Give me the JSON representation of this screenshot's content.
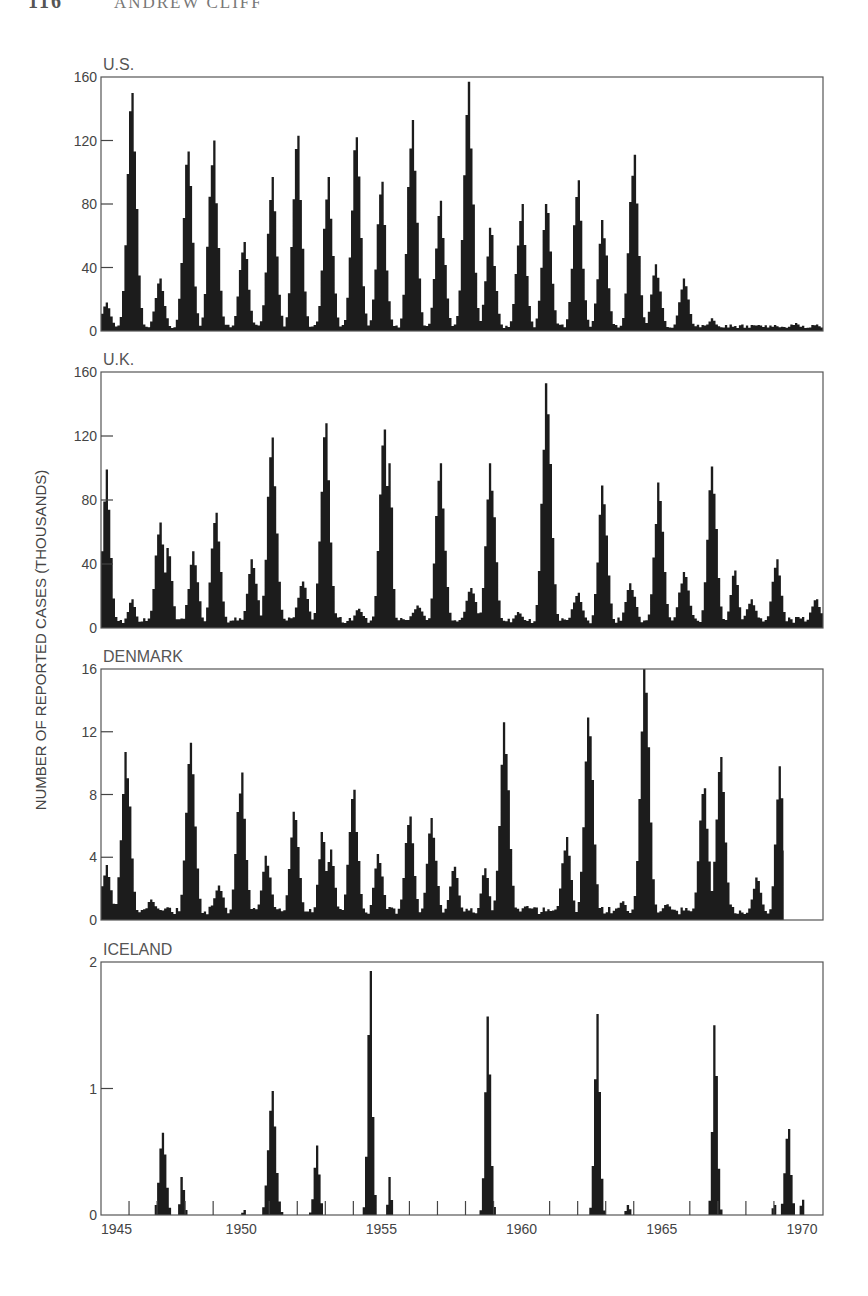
{
  "running_head": {
    "page_number": "116",
    "author": "ANDREW CLIFF"
  },
  "figure": {
    "ylabel": "NUMBER OF REPORTED CASES (THOUSANDS)",
    "x_axis": {
      "start_year": 1945,
      "end_year": 1970.75,
      "labels": [
        "1945",
        "1950",
        "1955",
        "1960",
        "1965",
        "1970"
      ],
      "label_years": [
        1945,
        1950,
        1955,
        1960,
        1965,
        1970
      ]
    }
  },
  "chart_data": [
    {
      "type": "bar",
      "title": "U.S.",
      "xlabel": "",
      "ylabel": "Number of reported cases (thousands)",
      "ylim": [
        0,
        160
      ],
      "yticks": [
        0,
        40,
        80,
        120,
        160
      ],
      "x_range": [
        1945,
        1970.75
      ],
      "grid": false,
      "baseline": 3,
      "peaks": [
        {
          "year": 1945.2,
          "value": 18,
          "width": 0.35
        },
        {
          "year": 1946.1,
          "value": 150,
          "width": 0.35
        },
        {
          "year": 1947.1,
          "value": 33,
          "width": 0.35
        },
        {
          "year": 1948.1,
          "value": 113,
          "width": 0.35
        },
        {
          "year": 1949.0,
          "value": 120,
          "width": 0.35
        },
        {
          "year": 1950.1,
          "value": 56,
          "width": 0.35
        },
        {
          "year": 1951.1,
          "value": 97,
          "width": 0.35
        },
        {
          "year": 1952.0,
          "value": 123,
          "width": 0.35
        },
        {
          "year": 1953.1,
          "value": 97,
          "width": 0.35
        },
        {
          "year": 1954.1,
          "value": 122,
          "width": 0.35
        },
        {
          "year": 1955.0,
          "value": 94,
          "width": 0.35
        },
        {
          "year": 1956.1,
          "value": 133,
          "width": 0.35
        },
        {
          "year": 1957.1,
          "value": 82,
          "width": 0.35
        },
        {
          "year": 1958.1,
          "value": 157,
          "width": 0.35
        },
        {
          "year": 1958.9,
          "value": 65,
          "width": 0.35
        },
        {
          "year": 1960.0,
          "value": 80,
          "width": 0.35
        },
        {
          "year": 1960.9,
          "value": 80,
          "width": 0.35
        },
        {
          "year": 1962.0,
          "value": 95,
          "width": 0.35
        },
        {
          "year": 1962.9,
          "value": 70,
          "width": 0.35
        },
        {
          "year": 1964.0,
          "value": 111,
          "width": 0.35
        },
        {
          "year": 1964.8,
          "value": 42,
          "width": 0.35
        },
        {
          "year": 1965.8,
          "value": 33,
          "width": 0.35
        },
        {
          "year": 1966.8,
          "value": 8,
          "width": 0.3
        },
        {
          "year": 1967.8,
          "value": 2,
          "width": 0.3
        },
        {
          "year": 1968.8,
          "value": 2,
          "width": 0.3
        },
        {
          "year": 1969.8,
          "value": 5,
          "width": 0.3
        },
        {
          "year": 1970.5,
          "value": 4,
          "width": 0.4
        }
      ]
    },
    {
      "type": "bar",
      "title": "U.K.",
      "xlabel": "",
      "ylabel": "Number of reported cases (thousands)",
      "ylim": [
        0,
        160
      ],
      "yticks": [
        0,
        40,
        80,
        120,
        160
      ],
      "x_range": [
        1945,
        1970.75
      ],
      "grid": false,
      "baseline": 5,
      "peaks": [
        {
          "year": 1945.2,
          "value": 99,
          "width": 0.3
        },
        {
          "year": 1946.1,
          "value": 18,
          "width": 0.3
        },
        {
          "year": 1947.1,
          "value": 66,
          "width": 0.35
        },
        {
          "year": 1947.4,
          "value": 50,
          "width": 0.3
        },
        {
          "year": 1948.3,
          "value": 48,
          "width": 0.35
        },
        {
          "year": 1949.1,
          "value": 72,
          "width": 0.35
        },
        {
          "year": 1950.4,
          "value": 43,
          "width": 0.35
        },
        {
          "year": 1951.1,
          "value": 119,
          "width": 0.35
        },
        {
          "year": 1952.2,
          "value": 29,
          "width": 0.4
        },
        {
          "year": 1953.0,
          "value": 128,
          "width": 0.35
        },
        {
          "year": 1954.2,
          "value": 12,
          "width": 0.4
        },
        {
          "year": 1955.1,
          "value": 124,
          "width": 0.35
        },
        {
          "year": 1955.3,
          "value": 103,
          "width": 0.2
        },
        {
          "year": 1956.3,
          "value": 14,
          "width": 0.5
        },
        {
          "year": 1957.1,
          "value": 103,
          "width": 0.35
        },
        {
          "year": 1958.2,
          "value": 25,
          "width": 0.4
        },
        {
          "year": 1958.9,
          "value": 103,
          "width": 0.35
        },
        {
          "year": 1959.9,
          "value": 10,
          "width": 0.4
        },
        {
          "year": 1960.9,
          "value": 153,
          "width": 0.35
        },
        {
          "year": 1962.0,
          "value": 22,
          "width": 0.4
        },
        {
          "year": 1962.9,
          "value": 89,
          "width": 0.35
        },
        {
          "year": 1963.9,
          "value": 28,
          "width": 0.4
        },
        {
          "year": 1964.9,
          "value": 91,
          "width": 0.35
        },
        {
          "year": 1965.8,
          "value": 35,
          "width": 0.4
        },
        {
          "year": 1966.8,
          "value": 101,
          "width": 0.35
        },
        {
          "year": 1967.6,
          "value": 36,
          "width": 0.3
        },
        {
          "year": 1968.2,
          "value": 18,
          "width": 0.4
        },
        {
          "year": 1969.1,
          "value": 43,
          "width": 0.35
        },
        {
          "year": 1970.5,
          "value": 18,
          "width": 0.4
        }
      ]
    },
    {
      "type": "bar",
      "title": "DENMARK",
      "xlabel": "",
      "ylabel": "Number of reported cases (thousands)",
      "ylim": [
        0,
        16
      ],
      "yticks": [
        0,
        4,
        8,
        12,
        16
      ],
      "x_range": [
        1945,
        1970.75
      ],
      "grid": false,
      "baseline": 0.6,
      "peaks": [
        {
          "year": 1945.2,
          "value": 3.5,
          "width": 0.35
        },
        {
          "year": 1945.9,
          "value": 10.7,
          "width": 0.35
        },
        {
          "year": 1946.8,
          "value": 1.3,
          "width": 0.4
        },
        {
          "year": 1948.2,
          "value": 11.3,
          "width": 0.35
        },
        {
          "year": 1949.2,
          "value": 2.2,
          "width": 0.4
        },
        {
          "year": 1950.0,
          "value": 9.4,
          "width": 0.35
        },
        {
          "year": 1950.9,
          "value": 4.1,
          "width": 0.35
        },
        {
          "year": 1951.9,
          "value": 6.9,
          "width": 0.35
        },
        {
          "year": 1952.9,
          "value": 5.6,
          "width": 0.3
        },
        {
          "year": 1953.2,
          "value": 4.5,
          "width": 0.3
        },
        {
          "year": 1954.0,
          "value": 8.3,
          "width": 0.35
        },
        {
          "year": 1954.9,
          "value": 4.2,
          "width": 0.35
        },
        {
          "year": 1956.0,
          "value": 6.6,
          "width": 0.35
        },
        {
          "year": 1956.8,
          "value": 6.5,
          "width": 0.35
        },
        {
          "year": 1957.6,
          "value": 3.4,
          "width": 0.35
        },
        {
          "year": 1958.7,
          "value": 3.3,
          "width": 0.3
        },
        {
          "year": 1959.4,
          "value": 12.6,
          "width": 0.35
        },
        {
          "year": 1960.2,
          "value": 0.9,
          "width": 0.5
        },
        {
          "year": 1961.6,
          "value": 5.3,
          "width": 0.35
        },
        {
          "year": 1962.4,
          "value": 12.9,
          "width": 0.35
        },
        {
          "year": 1963.6,
          "value": 1.2,
          "width": 0.35
        },
        {
          "year": 1964.4,
          "value": 16.0,
          "width": 0.35
        },
        {
          "year": 1965.2,
          "value": 1.0,
          "width": 0.5
        },
        {
          "year": 1966.5,
          "value": 8.4,
          "width": 0.35
        },
        {
          "year": 1967.1,
          "value": 10.4,
          "width": 0.35
        },
        {
          "year": 1968.4,
          "value": 2.7,
          "width": 0.35
        },
        {
          "year": 1969.2,
          "value": 9.8,
          "width": 0.3
        }
      ],
      "data_end_year": 1969.35
    },
    {
      "type": "bar",
      "title": "ICELAND",
      "xlabel": "",
      "ylabel": "Number of reported cases (thousands)",
      "ylim": [
        0,
        2
      ],
      "yticks": [
        0,
        1,
        2
      ],
      "x_range": [
        1945,
        1970.75
      ],
      "grid": false,
      "baseline": 0,
      "year_ticks": [
        1946,
        1947,
        1948,
        1949,
        1950,
        1951,
        1952,
        1953,
        1954,
        1955,
        1956,
        1957,
        1958,
        1959,
        1960,
        1961,
        1962,
        1963,
        1964,
        1965,
        1966,
        1967,
        1968,
        1969,
        1970
      ],
      "peaks": [
        {
          "year": 1947.2,
          "value": 0.65,
          "width": 0.25
        },
        {
          "year": 1947.9,
          "value": 0.3,
          "width": 0.15
        },
        {
          "year": 1950.1,
          "value": 0.04,
          "width": 0.1
        },
        {
          "year": 1951.1,
          "value": 0.98,
          "width": 0.28
        },
        {
          "year": 1952.7,
          "value": 0.55,
          "width": 0.2
        },
        {
          "year": 1954.6,
          "value": 1.93,
          "width": 0.18
        },
        {
          "year": 1955.3,
          "value": 0.3,
          "width": 0.12
        },
        {
          "year": 1958.8,
          "value": 1.57,
          "width": 0.2
        },
        {
          "year": 1962.7,
          "value": 1.59,
          "width": 0.2
        },
        {
          "year": 1963.8,
          "value": 0.08,
          "width": 0.15
        },
        {
          "year": 1966.9,
          "value": 1.5,
          "width": 0.18
        },
        {
          "year": 1969.0,
          "value": 0.08,
          "width": 0.1
        },
        {
          "year": 1969.5,
          "value": 0.68,
          "width": 0.22
        },
        {
          "year": 1970.0,
          "value": 0.12,
          "width": 0.1
        }
      ]
    }
  ],
  "layout": {
    "plot_left": 101,
    "plot_right": 823,
    "panels": [
      {
        "top": 77,
        "bottom": 331
      },
      {
        "top": 372,
        "bottom": 628
      },
      {
        "top": 669,
        "bottom": 920
      },
      {
        "top": 962,
        "bottom": 1215
      }
    ],
    "bar_color": "#1c1c1c",
    "frame_color": "#555555"
  }
}
